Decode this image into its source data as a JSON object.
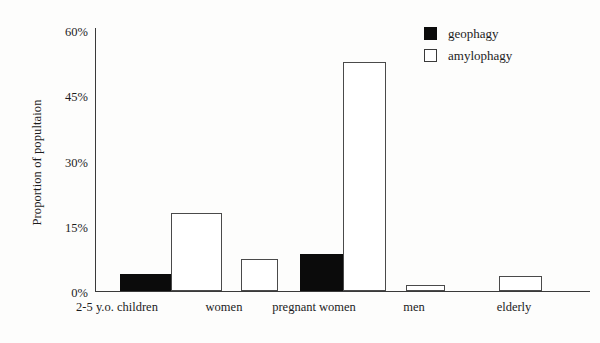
{
  "chart_data": {
    "type": "bar",
    "title": "",
    "subtitle": "",
    "xlabel": "",
    "ylabel": "Proportion of popultaion",
    "categories": [
      "2-5 y.o. children",
      "women",
      "pregnant women",
      "men",
      "elderly"
    ],
    "series": [
      {
        "name": "geophagy",
        "values": [
          4,
          0,
          8.5,
          0,
          0
        ]
      },
      {
        "name": "amylophagy",
        "values": [
          18,
          7.5,
          53,
          1.5,
          3.5
        ]
      }
    ],
    "ylim": [
      0,
      60
    ],
    "yticks": [
      0,
      15,
      30,
      45,
      60
    ],
    "ytick_labels": [
      "0%",
      "15%",
      "30%",
      "45%",
      "60%"
    ],
    "grid": false,
    "legend_position": "top-right",
    "colors": {
      "geophagy": "#0b0b0b",
      "amylophagy": "#ffffff",
      "outline": "#3a3a3a",
      "axis": "#3a3a3a",
      "background": "#fdfdfc",
      "text": "#1c1c1c"
    }
  },
  "axis": {
    "y_title": "Proportion of popultaion",
    "y_ticks": [
      {
        "label": "60%",
        "value": 60
      },
      {
        "label": "45%",
        "value": 45
      },
      {
        "label": "30%",
        "value": 30
      },
      {
        "label": "15%",
        "value": 15
      },
      {
        "label": "0%",
        "value": 0
      }
    ],
    "x_ticks": [
      {
        "label": "2-5 y.o. children"
      },
      {
        "label": "women"
      },
      {
        "label": "pregnant women"
      },
      {
        "label": "men"
      },
      {
        "label": "elderly"
      }
    ]
  },
  "legend": {
    "items": [
      {
        "label": "geophagy",
        "style": "filled"
      },
      {
        "label": "amylophagy",
        "style": "hollow"
      }
    ]
  }
}
